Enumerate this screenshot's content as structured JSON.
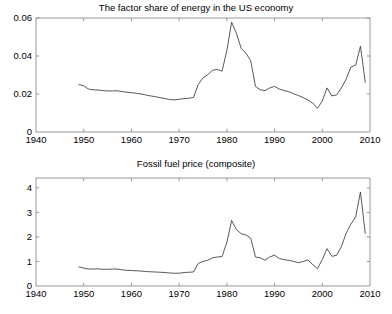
{
  "figure": {
    "background_color": "#ffffff",
    "line_color": "#3a3a3a",
    "axis_color": "#808080",
    "width": 392,
    "height": 314
  },
  "chart_data": [
    {
      "type": "line",
      "title": "The factor share of energy in the US economy",
      "xlabel": "",
      "ylabel": "",
      "xlim": [
        1940,
        2010
      ],
      "ylim": [
        0,
        0.06
      ],
      "xticks": [
        1940,
        1950,
        1960,
        1970,
        1980,
        1990,
        2000,
        2010
      ],
      "xtick_labels": [
        "1940",
        "1950",
        "1960",
        "1970",
        "1980",
        "1990",
        "2000",
        "2010"
      ],
      "yticks": [
        0,
        0.02,
        0.04,
        0.06
      ],
      "ytick_labels": [
        "0",
        "0.02",
        "0.04",
        "0.06"
      ],
      "grid": false,
      "legend": "none",
      "series": [
        {
          "name": "Energy factor share",
          "x": [
            1949,
            1950,
            1951,
            1952,
            1953,
            1954,
            1955,
            1956,
            1957,
            1958,
            1959,
            1960,
            1961,
            1962,
            1963,
            1964,
            1965,
            1966,
            1967,
            1968,
            1969,
            1970,
            1971,
            1972,
            1973,
            1974,
            1975,
            1976,
            1977,
            1978,
            1979,
            1980,
            1981,
            1982,
            1983,
            1984,
            1985,
            1986,
            1987,
            1988,
            1989,
            1990,
            1991,
            1992,
            1993,
            1994,
            1995,
            1996,
            1997,
            1998,
            1999,
            2000,
            2001,
            2002,
            2003,
            2004,
            2005,
            2006,
            2007,
            2008,
            2009
          ],
          "y": [
            0.025,
            0.0243,
            0.0226,
            0.0222,
            0.0221,
            0.0218,
            0.0216,
            0.0216,
            0.0217,
            0.0213,
            0.0209,
            0.0207,
            0.0204,
            0.02,
            0.0195,
            0.019,
            0.0186,
            0.0181,
            0.0176,
            0.0171,
            0.0169,
            0.0172,
            0.0176,
            0.0177,
            0.0182,
            0.025,
            0.0285,
            0.0302,
            0.0325,
            0.033,
            0.032,
            0.043,
            0.0578,
            0.052,
            0.044,
            0.0415,
            0.0375,
            0.024,
            0.0222,
            0.0218,
            0.0232,
            0.024,
            0.0226,
            0.0218,
            0.0212,
            0.0201,
            0.0192,
            0.0181,
            0.0168,
            0.0152,
            0.0125,
            0.0163,
            0.0232,
            0.019,
            0.0195,
            0.0232,
            0.0278,
            0.0342,
            0.0352,
            0.0452,
            0.0262
          ]
        }
      ]
    },
    {
      "type": "line",
      "title": "Fossil fuel price (composite)",
      "xlabel": "",
      "ylabel": "",
      "xlim": [
        1940,
        2010
      ],
      "ylim": [
        0,
        4.4
      ],
      "xticks": [
        1940,
        1950,
        1960,
        1970,
        1980,
        1990,
        2000,
        2010
      ],
      "xtick_labels": [
        "1940",
        "1950",
        "1960",
        "1970",
        "1980",
        "1990",
        "2000",
        "2010"
      ],
      "yticks": [
        0,
        1,
        2,
        3,
        4
      ],
      "ytick_labels": [
        "0",
        "1",
        "2",
        "3",
        "4"
      ],
      "grid": false,
      "legend": "none",
      "series": [
        {
          "name": "Fossil fuel composite price",
          "x": [
            1949,
            1950,
            1951,
            1952,
            1953,
            1954,
            1955,
            1956,
            1957,
            1958,
            1959,
            1960,
            1961,
            1962,
            1963,
            1964,
            1965,
            1966,
            1967,
            1968,
            1969,
            1970,
            1971,
            1972,
            1973,
            1974,
            1975,
            1976,
            1977,
            1978,
            1979,
            1980,
            1981,
            1982,
            1983,
            1984,
            1985,
            1986,
            1987,
            1988,
            1989,
            1990,
            1991,
            1992,
            1993,
            1994,
            1995,
            1996,
            1997,
            1998,
            1999,
            2000,
            2001,
            2002,
            2003,
            2004,
            2005,
            2006,
            2007,
            2008,
            2009
          ],
          "y": [
            0.78,
            0.73,
            0.69,
            0.69,
            0.7,
            0.68,
            0.68,
            0.69,
            0.69,
            0.66,
            0.64,
            0.63,
            0.62,
            0.61,
            0.59,
            0.58,
            0.57,
            0.56,
            0.55,
            0.53,
            0.52,
            0.52,
            0.55,
            0.56,
            0.57,
            0.92,
            1.0,
            1.05,
            1.15,
            1.18,
            1.2,
            1.78,
            2.67,
            2.3,
            2.13,
            2.08,
            1.95,
            1.18,
            1.15,
            1.05,
            1.18,
            1.26,
            1.12,
            1.07,
            1.05,
            1.0,
            0.95,
            1.0,
            1.06,
            0.87,
            0.71,
            1.08,
            1.52,
            1.21,
            1.25,
            1.6,
            2.15,
            2.52,
            2.82,
            3.83,
            2.15
          ]
        }
      ]
    }
  ]
}
